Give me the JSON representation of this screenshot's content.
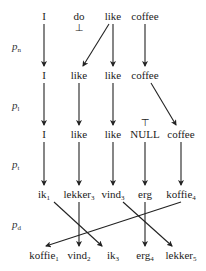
{
  "diagram": {
    "top_cut_text": "",
    "phase_labels": [
      {
        "base": "p",
        "sub": "n",
        "x": 12,
        "y": 40
      },
      {
        "base": "p",
        "sub": "l",
        "x": 12,
        "y": 99
      },
      {
        "base": "p",
        "sub": "t",
        "x": 12,
        "y": 158
      },
      {
        "base": "p",
        "sub": "d",
        "x": 12,
        "y": 218
      }
    ],
    "rows": [
      {
        "y": 10,
        "words": [
          {
            "text": "I",
            "sub": "",
            "x": 44
          },
          {
            "text": "do",
            "sub": "",
            "x": 79
          },
          {
            "text": "like",
            "sub": "",
            "x": 113
          },
          {
            "text": "coffee",
            "sub": "",
            "x": 145
          }
        ]
      },
      {
        "y": 69,
        "words": [
          {
            "text": "I",
            "sub": "",
            "x": 44
          },
          {
            "text": "like",
            "sub": "",
            "x": 79
          },
          {
            "text": "like",
            "sub": "",
            "x": 113
          },
          {
            "text": "coffee",
            "sub": "",
            "x": 145
          }
        ]
      },
      {
        "y": 128,
        "words": [
          {
            "text": "I",
            "sub": "",
            "x": 44
          },
          {
            "text": "like",
            "sub": "",
            "x": 79
          },
          {
            "text": "like",
            "sub": "",
            "x": 113
          },
          {
            "text": "NULL",
            "sub": "",
            "x": 145
          },
          {
            "text": "coffee",
            "sub": "",
            "x": 181
          }
        ]
      },
      {
        "y": 188,
        "words": [
          {
            "text": "ik",
            "sub": "1",
            "x": 44
          },
          {
            "text": "lekker",
            "sub": "3",
            "x": 79
          },
          {
            "text": "vind",
            "sub": "3",
            "x": 113
          },
          {
            "text": "erg",
            "sub": "",
            "x": 145
          },
          {
            "text": "koffie",
            "sub": "4",
            "x": 181
          }
        ]
      },
      {
        "y": 249,
        "words": [
          {
            "text": "koffie",
            "sub": "1",
            "x": 44
          },
          {
            "text": "vind",
            "sub": "2",
            "x": 79
          },
          {
            "text": "ik",
            "sub": "3",
            "x": 113
          },
          {
            "text": "erg",
            "sub": "4",
            "x": 145
          },
          {
            "text": "lekker",
            "sub": "5",
            "x": 181
          }
        ]
      }
    ],
    "marks": [
      {
        "symbol": "⊥",
        "x": 79,
        "y": 23,
        "meaning": "deletion"
      },
      {
        "symbol": "⊤",
        "x": 145,
        "y": 118,
        "meaning": "insertion"
      }
    ],
    "arrows": [
      {
        "from": [
          44,
          24
        ],
        "to": [
          44,
          66
        ]
      },
      {
        "from": [
          109,
          24
        ],
        "to": [
          83,
          66
        ]
      },
      {
        "from": [
          113,
          24
        ],
        "to": [
          113,
          66
        ]
      },
      {
        "from": [
          145,
          24
        ],
        "to": [
          145,
          66
        ]
      },
      {
        "from": [
          44,
          83
        ],
        "to": [
          44,
          125
        ]
      },
      {
        "from": [
          79,
          83
        ],
        "to": [
          79,
          125
        ]
      },
      {
        "from": [
          113,
          83
        ],
        "to": [
          113,
          125
        ]
      },
      {
        "from": [
          151,
          83
        ],
        "to": [
          176,
          125
        ]
      },
      {
        "from": [
          44,
          142
        ],
        "to": [
          44,
          185
        ]
      },
      {
        "from": [
          79,
          142
        ],
        "to": [
          79,
          185
        ]
      },
      {
        "from": [
          113,
          142
        ],
        "to": [
          113,
          185
        ]
      },
      {
        "from": [
          145,
          142
        ],
        "to": [
          145,
          185
        ]
      },
      {
        "from": [
          181,
          142
        ],
        "to": [
          181,
          185
        ]
      },
      {
        "from": [
          54,
          202
        ],
        "to": [
          102,
          246
        ]
      },
      {
        "from": [
          79,
          202
        ],
        "to": [
          79,
          246
        ]
      },
      {
        "from": [
          123,
          202
        ],
        "to": [
          172,
          246
        ]
      },
      {
        "from": [
          145,
          202
        ],
        "to": [
          145,
          246
        ]
      },
      {
        "from": [
          181,
          202
        ],
        "to": [
          46,
          246
        ]
      }
    ],
    "stroke_color": "#222222"
  }
}
